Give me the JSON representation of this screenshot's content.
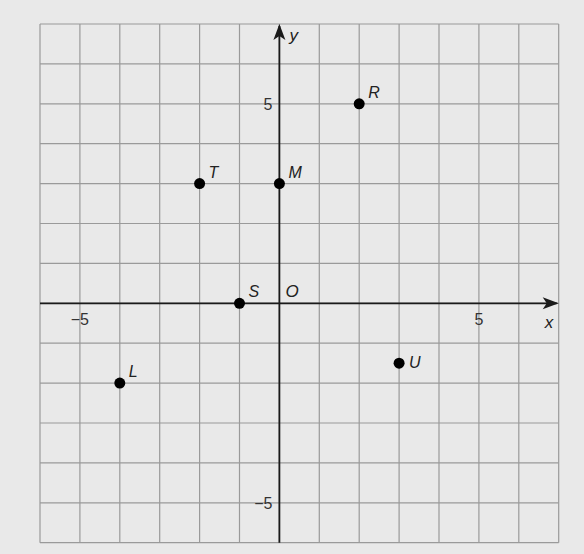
{
  "chart_data": {
    "type": "scatter",
    "title": "",
    "xlabel": "x",
    "ylabel": "y",
    "origin_label": "O",
    "xlim": [
      -6,
      7
    ],
    "ylim": [
      -6,
      7
    ],
    "grid": true,
    "x_ticks": [
      {
        "value": -5,
        "label": "−5"
      },
      {
        "value": 5,
        "label": "5"
      }
    ],
    "y_ticks": [
      {
        "value": 5,
        "label": "5"
      },
      {
        "value": -5,
        "label": "−5"
      }
    ],
    "points": [
      {
        "label": "R",
        "x": 2,
        "y": 5
      },
      {
        "label": "T",
        "x": -2,
        "y": 3
      },
      {
        "label": "M",
        "x": 0,
        "y": 3
      },
      {
        "label": "S",
        "x": -1,
        "y": 0
      },
      {
        "label": "U",
        "x": 3,
        "y": -1.5
      },
      {
        "label": "L",
        "x": -4,
        "y": -2
      }
    ]
  },
  "colors": {
    "background": "#e9e9e9",
    "grid": "#9a9a9a",
    "axis": "#1a1a1a",
    "point": "#000000"
  }
}
